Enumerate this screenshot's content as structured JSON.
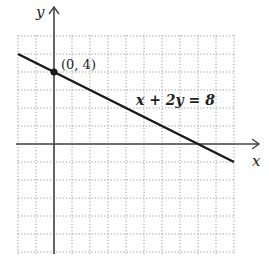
{
  "chart_data": {
    "type": "line",
    "title": "",
    "xlabel": "x",
    "ylabel": "y",
    "xlim": [
      -2,
      10
    ],
    "ylim": [
      -6,
      6
    ],
    "grid": true,
    "series": [
      {
        "name": "x + 2y = 8",
        "x": [
          -2,
          10
        ],
        "y": [
          5,
          -1
        ]
      }
    ],
    "points": [
      {
        "x": 0,
        "y": 4,
        "label": "(0, 4)"
      }
    ],
    "annotations": [
      {
        "text": "x + 2y = 8",
        "x": 4.6,
        "y": 3.8
      }
    ],
    "legend": "none"
  },
  "labels": {
    "x_axis": "x",
    "y_axis": "y",
    "point": "(0, 4)",
    "equation": "x + 2y = 8"
  },
  "colors": {
    "line": "#1a1a1a",
    "axis": "#444444",
    "grid": "#9a9a9a"
  }
}
